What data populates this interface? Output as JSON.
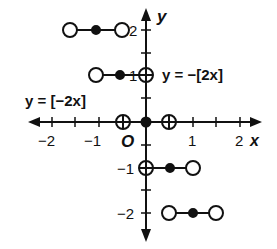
{
  "graph": {
    "axes": {
      "x_label": "x",
      "y_label": "y",
      "origin_label": "O",
      "x_ticks": [
        {
          "value": -2,
          "label": "−2"
        },
        {
          "value": -1,
          "label": "−1"
        },
        {
          "value": 1,
          "label": "1"
        },
        {
          "value": 2,
          "label": "2"
        }
      ],
      "y_ticks": [
        {
          "value": 2,
          "label": "2"
        },
        {
          "value": 1,
          "label": "1"
        },
        {
          "value": -1,
          "label": "−1"
        },
        {
          "value": -2,
          "label": "−2"
        }
      ]
    },
    "equations": {
      "left": "y = [−2x]",
      "right": "y = −[2x]"
    },
    "segments": [
      {
        "y": 2,
        "x_start": -1,
        "x_mid": -0.75,
        "x_end": -0.5
      },
      {
        "y": 1,
        "x_start": -0.5,
        "x_mid": -0.25,
        "x_end": 0
      },
      {
        "y": 0,
        "x_start": -0.5,
        "x_mid": 0,
        "x_end": 0.5
      },
      {
        "y": -1,
        "x_start": 0,
        "x_mid": 0.25,
        "x_end": 0.5
      },
      {
        "y": -2,
        "x_start": 0.5,
        "x_mid": 0.75,
        "x_end": 1
      }
    ]
  }
}
